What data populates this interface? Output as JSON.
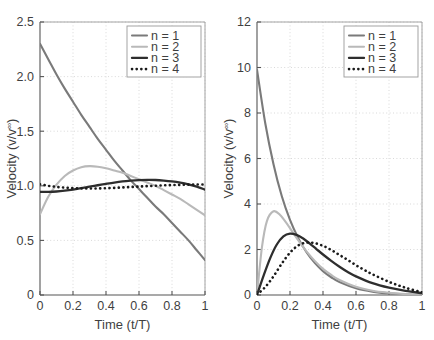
{
  "figure": {
    "panel_count": 2
  },
  "chart_data": [
    {
      "type": "line",
      "panel": "left",
      "title": "",
      "xlabel": "Time (t/T)",
      "ylabel": "Velocity (v/v∞)",
      "ylabel_base": "Velocity (v/v",
      "ylabel_sup": "∞",
      "ylabel_close": ")",
      "xlim": [
        0,
        1
      ],
      "ylim": [
        0,
        2.5
      ],
      "xticks": [
        0,
        0.2,
        0.4,
        0.6,
        0.8,
        1
      ],
      "xticklabels": [
        "0",
        "0.2",
        "0.4",
        "0.6",
        "0.8",
        "1"
      ],
      "yticks": [
        0,
        0.5,
        1.0,
        1.5,
        2.0,
        2.5
      ],
      "yticklabels": [
        "0",
        "0.5",
        "1.0",
        "1.5",
        "2.0",
        "2.5"
      ],
      "grid": true,
      "grid_style": "dotted",
      "legend_position": "top-right",
      "series": [
        {
          "name": "n = 1",
          "color": "#7a7a7a",
          "style": "solid",
          "width": 2.1,
          "x": [
            0,
            0.05,
            0.1,
            0.15,
            0.2,
            0.25,
            0.3,
            0.35,
            0.4,
            0.45,
            0.5,
            0.55,
            0.6,
            0.65,
            0.7,
            0.75,
            0.8,
            0.85,
            0.9,
            0.95,
            1
          ],
          "values": [
            2.3,
            2.16,
            2.02,
            1.89,
            1.77,
            1.65,
            1.54,
            1.43,
            1.33,
            1.23,
            1.14,
            1.05,
            0.97,
            0.89,
            0.81,
            0.74,
            0.66,
            0.58,
            0.5,
            0.41,
            0.32
          ]
        },
        {
          "name": "n = 2",
          "color": "#b9b9b9",
          "style": "solid",
          "width": 2.1,
          "x": [
            0,
            0.05,
            0.1,
            0.15,
            0.2,
            0.25,
            0.3,
            0.35,
            0.4,
            0.45,
            0.5,
            0.55,
            0.6,
            0.65,
            0.7,
            0.75,
            0.8,
            0.85,
            0.9,
            0.95,
            1
          ],
          "values": [
            0.74,
            0.9,
            1.01,
            1.09,
            1.14,
            1.17,
            1.18,
            1.175,
            1.16,
            1.14,
            1.12,
            1.09,
            1.06,
            1.03,
            1.0,
            0.96,
            0.92,
            0.88,
            0.83,
            0.78,
            0.73
          ]
        },
        {
          "name": "n = 3",
          "color": "#2e2e2e",
          "style": "solid",
          "width": 2.3,
          "x": [
            0,
            0.05,
            0.1,
            0.15,
            0.2,
            0.25,
            0.3,
            0.35,
            0.4,
            0.45,
            0.5,
            0.55,
            0.6,
            0.65,
            0.7,
            0.75,
            0.8,
            0.85,
            0.9,
            0.95,
            1
          ],
          "values": [
            0.945,
            0.945,
            0.948,
            0.955,
            0.965,
            0.978,
            0.992,
            1.005,
            1.018,
            1.03,
            1.04,
            1.047,
            1.052,
            1.054,
            1.053,
            1.048,
            1.04,
            1.028,
            1.012,
            0.992,
            0.965
          ]
        },
        {
          "name": "n = 4",
          "color": "#1a1a1a",
          "style": "dotted",
          "width": 2.6,
          "x": [
            0,
            0.05,
            0.1,
            0.15,
            0.2,
            0.25,
            0.3,
            0.35,
            0.4,
            0.45,
            0.5,
            0.55,
            0.6,
            0.65,
            0.7,
            0.75,
            0.8,
            0.85,
            0.9,
            0.95,
            1
          ],
          "values": [
            1.015,
            1.0,
            0.99,
            0.983,
            0.978,
            0.976,
            0.975,
            0.976,
            0.978,
            0.981,
            0.985,
            0.989,
            0.993,
            0.997,
            1.0,
            1.004,
            1.007,
            1.009,
            1.011,
            1.012,
            1.012
          ]
        }
      ]
    },
    {
      "type": "line",
      "panel": "right",
      "title": "",
      "xlabel": "Time (t/T)",
      "ylabel": "Velocity (v/v∞)",
      "ylabel_base": "Velocity (v/v",
      "ylabel_sup": "∞",
      "ylabel_close": ")",
      "xlim": [
        0,
        1
      ],
      "ylim": [
        0,
        12
      ],
      "xticks": [
        0,
        0.2,
        0.4,
        0.6,
        0.8,
        1
      ],
      "xticklabels": [
        "0",
        "0.2",
        "0.4",
        "0.6",
        "0.8",
        "1"
      ],
      "yticks": [
        0,
        2,
        4,
        6,
        8,
        10,
        12
      ],
      "yticklabels": [
        "0",
        "2",
        "4",
        "6",
        "8",
        "10",
        "12"
      ],
      "grid": true,
      "grid_style": "dotted",
      "legend_position": "top-right",
      "series": [
        {
          "name": "n = 1",
          "color": "#7a7a7a",
          "style": "solid",
          "width": 2.1,
          "x": [
            0,
            0.05,
            0.1,
            0.15,
            0.2,
            0.25,
            0.3,
            0.35,
            0.4,
            0.45,
            0.5,
            0.6,
            0.7,
            0.8,
            0.9,
            1
          ],
          "values": [
            9.9,
            7.55,
            5.75,
            4.35,
            3.3,
            2.5,
            1.88,
            1.41,
            1.05,
            0.78,
            0.57,
            0.3,
            0.15,
            0.07,
            0.03,
            0.01
          ]
        },
        {
          "name": "n = 2",
          "color": "#b9b9b9",
          "style": "solid",
          "width": 2.1,
          "x": [
            0,
            0.03,
            0.06,
            0.1,
            0.14,
            0.18,
            0.22,
            0.26,
            0.3,
            0.35,
            0.4,
            0.45,
            0.5,
            0.6,
            0.7,
            0.8,
            0.9,
            1
          ],
          "values": [
            0.0,
            2.1,
            3.25,
            3.68,
            3.52,
            3.15,
            2.72,
            2.3,
            1.92,
            1.5,
            1.15,
            0.88,
            0.66,
            0.36,
            0.19,
            0.1,
            0.04,
            0.02
          ]
        },
        {
          "name": "n = 3",
          "color": "#2e2e2e",
          "style": "solid",
          "width": 2.3,
          "x": [
            0,
            0.04,
            0.08,
            0.12,
            0.16,
            0.2,
            0.24,
            0.28,
            0.32,
            0.36,
            0.4,
            0.45,
            0.5,
            0.55,
            0.6,
            0.7,
            0.8,
            0.9,
            1
          ],
          "values": [
            0.0,
            0.85,
            1.62,
            2.22,
            2.58,
            2.7,
            2.64,
            2.48,
            2.26,
            2.02,
            1.78,
            1.5,
            1.24,
            1.01,
            0.82,
            0.52,
            0.32,
            0.18,
            0.08
          ]
        },
        {
          "name": "n = 4",
          "color": "#1a1a1a",
          "style": "dotted",
          "width": 2.6,
          "x": [
            0,
            0.05,
            0.1,
            0.15,
            0.2,
            0.25,
            0.3,
            0.35,
            0.4,
            0.45,
            0.5,
            0.55,
            0.6,
            0.65,
            0.7,
            0.8,
            0.9,
            1
          ],
          "values": [
            0.02,
            0.35,
            0.82,
            1.38,
            1.86,
            2.18,
            2.3,
            2.28,
            2.16,
            1.98,
            1.76,
            1.54,
            1.31,
            1.1,
            0.91,
            0.58,
            0.32,
            0.12
          ]
        }
      ]
    }
  ]
}
